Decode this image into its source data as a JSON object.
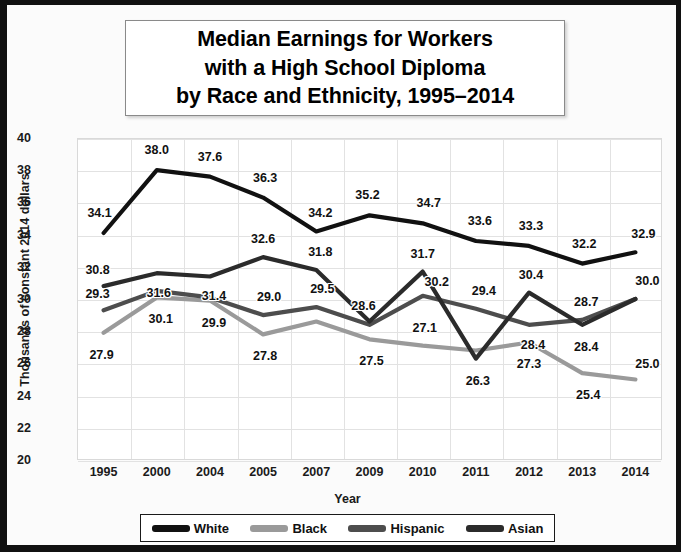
{
  "title": {
    "line1": "Median Earnings for Workers",
    "line2": "with a High School Diploma",
    "line3": "by Race and Ethnicity, 1995–2014"
  },
  "axes": {
    "xlabel": "Year",
    "ylabel": "Thousands of constant 2014 dollars",
    "yticks": [
      "40",
      "38",
      "36",
      "34",
      "32",
      "30",
      "28",
      "26",
      "24",
      "22",
      "20"
    ],
    "xticks": [
      "1995",
      "2000",
      "2004",
      "2005",
      "2007",
      "2009",
      "2010",
      "2011",
      "2012",
      "2013",
      "2014"
    ]
  },
  "legend": {
    "items": [
      {
        "label": "White",
        "color": "#111111"
      },
      {
        "label": "Black",
        "color": "#9a9a9a"
      },
      {
        "label": "Hispanic",
        "color": "#4d4d4d"
      },
      {
        "label": "Asian",
        "color": "#2b2b2b"
      }
    ]
  },
  "chart_data": {
    "type": "line",
    "title": "Median Earnings for Workers with a High School Diploma by Race and Ethnicity, 1995–2014",
    "xlabel": "Year",
    "ylabel": "Thousands of constant 2014 dollars",
    "categories": [
      "1995",
      "2000",
      "2004",
      "2005",
      "2007",
      "2009",
      "2010",
      "2011",
      "2012",
      "2013",
      "2014"
    ],
    "ylim": [
      20,
      40
    ],
    "ytick_step": 2,
    "grid": true,
    "legend_position": "bottom",
    "series": [
      {
        "name": "White",
        "color": "#111111",
        "values": [
          34.1,
          38.0,
          37.6,
          36.3,
          34.2,
          35.2,
          34.7,
          33.6,
          33.3,
          32.2,
          32.9
        ],
        "labels": [
          "34.1",
          "38.0",
          "37.6",
          "36.3",
          "34.2",
          "35.2",
          "34.7",
          "33.6",
          "33.3",
          "32.2",
          "32.9"
        ]
      },
      {
        "name": "Black",
        "color": "#9a9a9a",
        "values": [
          27.9,
          30.1,
          29.9,
          27.8,
          28.6,
          27.5,
          27.1,
          26.8,
          27.3,
          25.4,
          25.0
        ],
        "labels": [
          "27.9",
          "30.1",
          "29.9",
          "27.8",
          "",
          "27.5",
          "27.1",
          "",
          "27.3",
          "25.4",
          "25.0"
        ]
      },
      {
        "name": "Hispanic",
        "color": "#4d4d4d",
        "values": [
          29.3,
          30.5,
          30.1,
          29.0,
          29.5,
          28.4,
          30.2,
          29.4,
          28.4,
          28.7,
          30.0
        ],
        "labels": [
          "29.3",
          "",
          "",
          "29.0",
          "29.5",
          "",
          "30.2",
          "29.4",
          "28.4",
          "28.7",
          "30.0"
        ]
      },
      {
        "name": "Asian",
        "color": "#2b2b2b",
        "values": [
          30.8,
          31.6,
          31.4,
          32.6,
          31.8,
          28.6,
          31.7,
          26.3,
          30.4,
          28.4,
          30.0
        ],
        "labels": [
          "30.8",
          "31.6",
          "31.4",
          "32.6",
          "31.8",
          "28.6",
          "31.7",
          "26.3",
          "30.4",
          "28.4",
          ""
        ]
      }
    ]
  }
}
